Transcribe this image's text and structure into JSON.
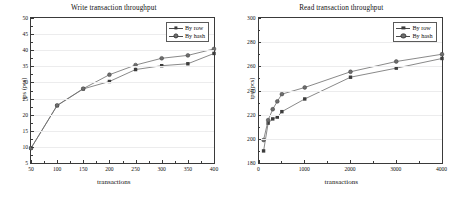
{
  "figure": {
    "background": "#ffffff",
    "line_color": "#6b6b6b",
    "marker_row_color": "#3c3c3c",
    "marker_hash_color": "#6e6e6e",
    "axis_color": "#3a3a3a",
    "grid_color": "#ececed"
  },
  "legend": {
    "series_row_label": "By row",
    "series_hash_label": "By hash"
  },
  "chart_data": [
    {
      "type": "line",
      "title": "Write transaction throughput",
      "xlabel": "transactions",
      "ylabel": "tps (pcs)",
      "xlim": [
        50,
        400
      ],
      "ylim": [
        5,
        50
      ],
      "xticks": [
        50,
        100,
        150,
        200,
        250,
        300,
        350,
        400
      ],
      "yticks": [
        5,
        10,
        15,
        20,
        25,
        30,
        35,
        40,
        45,
        50
      ],
      "xtick_labels": [
        "50",
        "100",
        "150",
        "200",
        "250",
        "300",
        "350",
        "400"
      ],
      "ytick_labels": [
        "5",
        "10",
        "15",
        "20",
        "25",
        "30",
        "35",
        "40",
        "45",
        "50"
      ],
      "grid": true,
      "legend_position": "top-right",
      "x": [
        50,
        100,
        150,
        200,
        250,
        300,
        350,
        400
      ],
      "series": [
        {
          "name": "By row",
          "marker": "square",
          "values": [
            9.6,
            22.8,
            28.0,
            30.3,
            34.0,
            35.2,
            35.8,
            39.0
          ]
        },
        {
          "name": "By hash",
          "marker": "circle",
          "values": [
            9.6,
            22.9,
            28.1,
            32.4,
            35.4,
            37.5,
            38.4,
            40.4
          ]
        }
      ]
    },
    {
      "type": "line",
      "title": "Read transaction throughput",
      "xlabel": "transactions",
      "ylabel": "tps (pcs)",
      "xlim": [
        0,
        4000
      ],
      "ylim": [
        180,
        300
      ],
      "xticks": [
        0,
        1000,
        2000,
        3000,
        4000
      ],
      "yticks": [
        180,
        200,
        220,
        240,
        260,
        280,
        300
      ],
      "xtick_labels": [
        "0",
        "1000",
        "2000",
        "3000",
        "4000"
      ],
      "ytick_labels": [
        "180",
        "200",
        "220",
        "240",
        "260",
        "280",
        "300"
      ],
      "grid": true,
      "legend_position": "top-right",
      "x": [
        100,
        200,
        300,
        400,
        500,
        1000,
        2000,
        3000,
        4000
      ],
      "series": [
        {
          "name": "By row",
          "marker": "square",
          "values": [
            190.0,
            213.0,
            216.5,
            218.0,
            222.5,
            233.0,
            251.0,
            258.5,
            266.5
          ]
        },
        {
          "name": "By hash",
          "marker": "circle",
          "values": [
            199.0,
            215.5,
            224.5,
            231.0,
            237.0,
            242.5,
            255.5,
            264.0,
            270.0
          ]
        }
      ]
    }
  ]
}
